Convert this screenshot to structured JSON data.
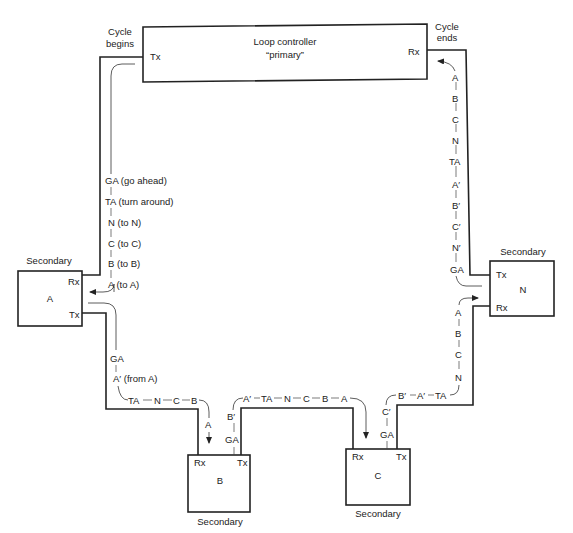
{
  "primary": {
    "title_line1": "Loop controller",
    "title_line2": "“primary”",
    "tx": "Tx",
    "rx": "Rx",
    "cycle_begins_1": "Cycle",
    "cycle_begins_2": "begins",
    "cycle_ends_1": "Cycle",
    "cycle_ends_2": "ends"
  },
  "secondaries": {
    "A": {
      "caption": "Secondary",
      "name": "A",
      "rx": "Rx",
      "tx": "Tx"
    },
    "B": {
      "caption": "Secondary",
      "name": "B",
      "rx": "Rx",
      "tx": "Tx"
    },
    "C": {
      "caption": "Secondary",
      "name": "C",
      "rx": "Rx",
      "tx": "Tx"
    },
    "N": {
      "caption": "Secondary",
      "name": "N",
      "rx": "Rx",
      "tx": "Tx"
    }
  },
  "flows": {
    "primary_to_A": [
      "GA (go ahead)",
      "TA (turn around)",
      "N (to N)",
      "C (to C)",
      "B (to B)",
      "A (to A)"
    ],
    "A_out_vertical": [
      "GA",
      "A′ (from A)"
    ],
    "A_out_horizontal": [
      "TA",
      "N",
      "C",
      "B"
    ],
    "into_B": "A",
    "B_out_vertical": [
      "GA",
      "B′"
    ],
    "B_out_horizontal": [
      "A′",
      "TA",
      "N",
      "C",
      "B",
      "A"
    ],
    "C_out_vertical": [
      "GA",
      "C′"
    ],
    "C_out_horizontal": [
      "B′",
      "A′",
      "TA"
    ],
    "into_N": [
      "N",
      "C",
      "B",
      "A"
    ],
    "N_to_primary": [
      "GA",
      "N′",
      "C′",
      "B′",
      "A′",
      "TA",
      "N",
      "C",
      "B",
      "A"
    ]
  }
}
